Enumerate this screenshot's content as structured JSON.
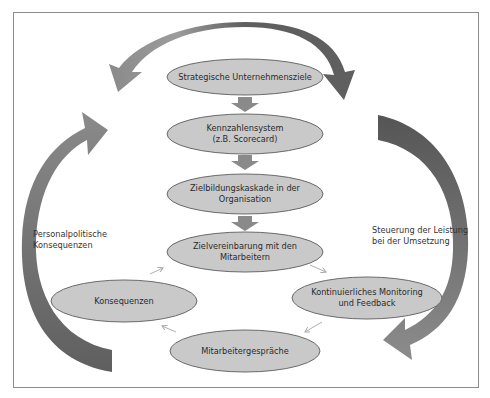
{
  "diagram": {
    "nodes": [
      {
        "id": "strategic-goals",
        "lines": [
          "Strategische Unternehmensziele"
        ]
      },
      {
        "id": "kpi-system",
        "lines": [
          "Kennzahlensystem",
          "(z.B. Scorecard)"
        ]
      },
      {
        "id": "goal-cascade",
        "lines": [
          "Zielbildungskaskade in der",
          "Organisation"
        ]
      },
      {
        "id": "goal-agreement",
        "lines": [
          "Zielvereinbarung mit den",
          "Mitarbeitern"
        ]
      },
      {
        "id": "consequences",
        "lines": [
          "Konsequenzen"
        ]
      },
      {
        "id": "monitoring",
        "lines": [
          "Kontinuierliches Monitoring",
          "und Feedback"
        ]
      },
      {
        "id": "employee-talks",
        "lines": [
          "Mitarbeitergespräche"
        ]
      }
    ],
    "side_labels": {
      "left": [
        "Personalpolitische",
        "Konsequenzen"
      ],
      "right": [
        "Steuerung der Leistung",
        "bei der Umsetzung"
      ]
    },
    "colors": {
      "node_fill": "#c9c9c9",
      "node_stroke": "#6a6a6a",
      "big_arrow": "#6e6e6e",
      "big_arrow_light": "#9a9a9a",
      "small_arrow": "#8a8a8a",
      "thin_arrow": "#b0b0b0",
      "frame": "#8c8c8c"
    }
  }
}
